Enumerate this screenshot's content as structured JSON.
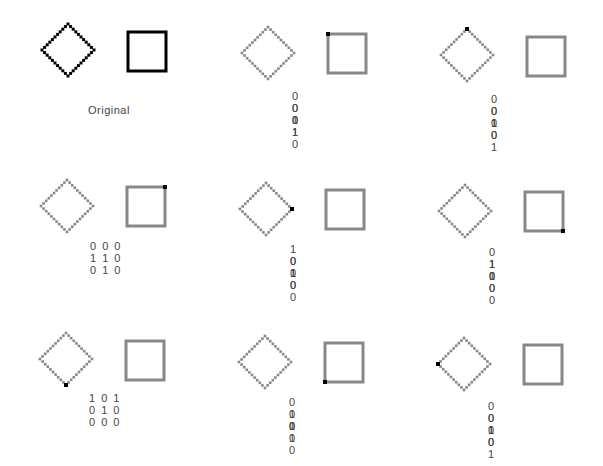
{
  "colors": {
    "original_stroke": "#000000",
    "faded_stroke": "#888888",
    "marker": "#000000",
    "text": "#444444"
  },
  "panels": [
    {
      "id": "original",
      "label": "Original",
      "style": "original",
      "marker": null,
      "matrix": []
    },
    {
      "id": "p2",
      "label": "",
      "style": "faded",
      "marker": {
        "shape": "square",
        "corner": "top-left"
      },
      "matrix": [
        "000",
        "011",
        "010"
      ]
    },
    {
      "id": "p3",
      "label": "",
      "style": "faded",
      "marker": {
        "shape": "diamond",
        "corner": "top"
      },
      "matrix": [
        "000",
        "010",
        "101"
      ]
    },
    {
      "id": "p4",
      "label": "",
      "style": "faded",
      "marker": {
        "shape": "square",
        "corner": "top-right"
      },
      "matrix": [
        "000",
        "110",
        "010"
      ]
    },
    {
      "id": "p5",
      "label": "",
      "style": "faded",
      "marker": {
        "shape": "diamond",
        "corner": "right"
      },
      "matrix": [
        "100",
        "010",
        "100"
      ]
    },
    {
      "id": "p6",
      "label": "",
      "style": "faded",
      "marker": {
        "shape": "square",
        "corner": "bottom-right"
      },
      "matrix": [
        "010",
        "110",
        "000"
      ]
    },
    {
      "id": "p7",
      "label": "",
      "style": "faded",
      "marker": {
        "shape": "diamond",
        "corner": "bottom"
      },
      "matrix": [
        "101",
        "010",
        "000"
      ]
    },
    {
      "id": "p8",
      "label": "",
      "style": "faded",
      "marker": {
        "shape": "square",
        "corner": "bottom-left"
      },
      "matrix": [
        "010",
        "011",
        "000"
      ]
    },
    {
      "id": "p9",
      "label": "",
      "style": "faded",
      "marker": {
        "shape": "diamond",
        "corner": "left"
      },
      "matrix": [
        "001",
        "010",
        "001"
      ]
    }
  ]
}
